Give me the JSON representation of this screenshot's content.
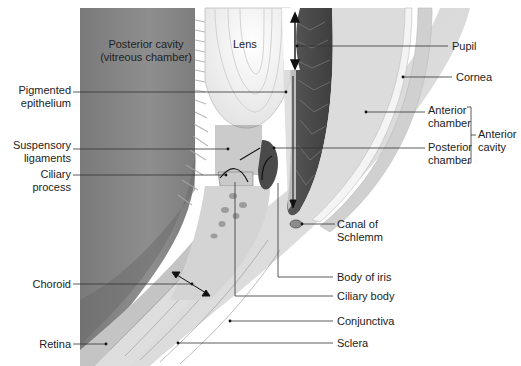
{
  "diagram": {
    "colors": {
      "vitreous": "#8a8a8a",
      "vitreous_dark": "#6f6f6f",
      "lens": "#f2f2f2",
      "iris": "#4d4d4d",
      "sclera": "#d9d9d9",
      "anterior_chamber": "#dcdcdc",
      "cornea": "#cfcfcf",
      "leader_line": "#333333",
      "background": "#ffffff"
    },
    "region_labels": {
      "posterior_cavity": {
        "line1": "Posterior cavity",
        "line2": "(vitreous chamber)"
      },
      "lens": "Lens"
    },
    "left_labels": [
      {
        "id": "pigmented-epithelium",
        "line1": "Pigmented",
        "line2": "epithelium"
      },
      {
        "id": "suspensory-ligaments",
        "line1": "Suspensory",
        "line2": "ligaments"
      },
      {
        "id": "ciliary-process",
        "line1": "Ciliary",
        "line2": "process"
      },
      {
        "id": "choroid",
        "line1": "Choroid",
        "line2": ""
      },
      {
        "id": "retina",
        "line1": "Retina",
        "line2": ""
      }
    ],
    "right_labels": [
      {
        "id": "pupil",
        "line1": "Pupil",
        "line2": ""
      },
      {
        "id": "cornea",
        "line1": "Cornea",
        "line2": ""
      },
      {
        "id": "anterior-chamber",
        "line1": "Anterior",
        "line2": "chamber"
      },
      {
        "id": "posterior-chamber",
        "line1": "Posterior",
        "line2": "chamber"
      },
      {
        "id": "canal-of-schlemm",
        "line1": "Canal of",
        "line2": "Schlemm"
      },
      {
        "id": "body-of-iris",
        "line1": "Body of iris",
        "line2": ""
      },
      {
        "id": "ciliary-body",
        "line1": "Ciliary body",
        "line2": ""
      },
      {
        "id": "conjunctiva",
        "line1": "Conjunctiva",
        "line2": ""
      },
      {
        "id": "sclera",
        "line1": "Sclera",
        "line2": ""
      }
    ],
    "group_label": {
      "id": "anterior-cavity",
      "line1": "Anterior",
      "line2": "cavity"
    }
  }
}
